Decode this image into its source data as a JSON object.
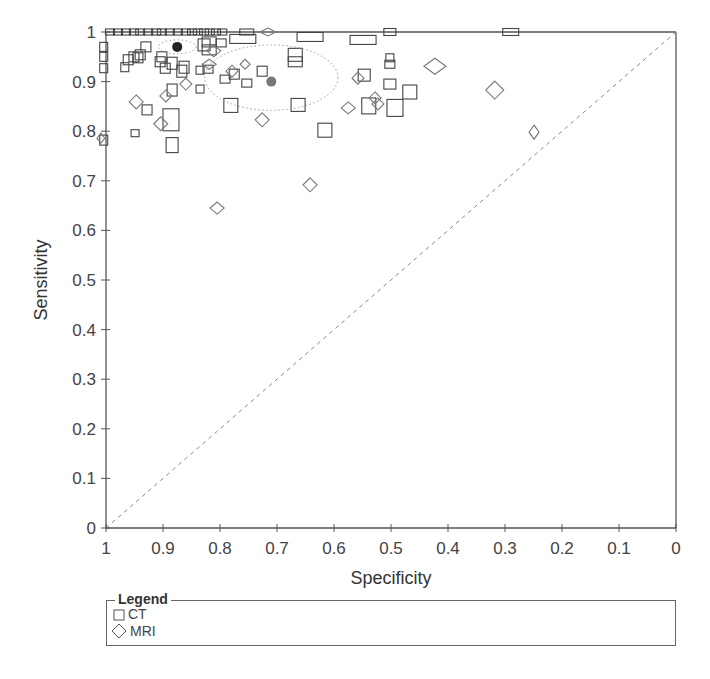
{
  "chart_data": {
    "type": "scatter",
    "title": "",
    "xlabel": "Specificity",
    "ylabel": "Sensitivity",
    "xlim": [
      1,
      0
    ],
    "ylim": [
      0,
      1
    ],
    "x_reversed": true,
    "x_ticks": [
      "1",
      "0.9",
      "0.8",
      "0.7",
      "0.6",
      "0.5",
      "0.4",
      "0.3",
      "0.2",
      "0.1",
      "0"
    ],
    "y_ticks": [
      "0",
      "0.1",
      "0.2",
      "0.3",
      "0.4",
      "0.5",
      "0.6",
      "0.7",
      "0.8",
      "0.9",
      "1"
    ],
    "grid": false,
    "reference_line": {
      "type": "diagonal-dashed",
      "from": [
        1,
        0
      ],
      "to": [
        0,
        1
      ],
      "color": "#888888"
    },
    "legend": {
      "title": "Legend",
      "position": "below",
      "entries": [
        {
          "label": "CT",
          "marker": "square"
        },
        {
          "label": "MRI",
          "marker": "diamond"
        }
      ]
    },
    "summary_points": [
      {
        "series": "CT",
        "specificity": 0.875,
        "sensitivity": 0.97,
        "color": "#222222",
        "confidence_region": {
          "rx_spec": 0.033,
          "ry_sens": 0.014
        }
      },
      {
        "series": "MRI",
        "specificity": 0.71,
        "sensitivity": 0.9,
        "color": "#777777",
        "confidence_region": {
          "rx_spec": 0.117,
          "ry_sens": 0.066
        }
      }
    ],
    "series": [
      {
        "name": "CT",
        "marker": "square",
        "points": [
          {
            "spec": 0.993,
            "sens": 1.0,
            "w": 9,
            "h": 6
          },
          {
            "spec": 0.979,
            "sens": 1.0,
            "w": 9,
            "h": 6
          },
          {
            "spec": 0.965,
            "sens": 1.0,
            "w": 9,
            "h": 6
          },
          {
            "spec": 0.951,
            "sens": 1.0,
            "w": 9,
            "h": 6
          },
          {
            "spec": 0.94,
            "sens": 1.0,
            "w": 9,
            "h": 6
          },
          {
            "spec": 0.926,
            "sens": 1.0,
            "w": 9,
            "h": 6
          },
          {
            "spec": 0.912,
            "sens": 1.0,
            "w": 9,
            "h": 6
          },
          {
            "spec": 0.902,
            "sens": 1.0,
            "w": 9,
            "h": 6
          },
          {
            "spec": 0.888,
            "sens": 1.0,
            "w": 9,
            "h": 6
          },
          {
            "spec": 0.874,
            "sens": 1.0,
            "w": 9,
            "h": 6
          },
          {
            "spec": 0.86,
            "sens": 1.0,
            "w": 9,
            "h": 6
          },
          {
            "spec": 0.849,
            "sens": 1.0,
            "w": 9,
            "h": 6
          },
          {
            "spec": 0.839,
            "sens": 1.0,
            "w": 9,
            "h": 6
          },
          {
            "spec": 0.828,
            "sens": 1.0,
            "w": 9,
            "h": 6
          },
          {
            "spec": 0.818,
            "sens": 1.0,
            "w": 9,
            "h": 6
          },
          {
            "spec": 0.807,
            "sens": 1.0,
            "w": 9,
            "h": 6
          },
          {
            "spec": 0.796,
            "sens": 1.0,
            "w": 9,
            "h": 6
          },
          {
            "spec": 0.753,
            "sens": 1.0,
            "w": 14,
            "h": 6
          },
          {
            "spec": 0.502,
            "sens": 1.0,
            "w": 12,
            "h": 7
          },
          {
            "spec": 0.29,
            "sens": 1.0,
            "w": 16,
            "h": 7
          },
          {
            "spec": 0.76,
            "sens": 0.986,
            "w": 26,
            "h": 9
          },
          {
            "spec": 0.642,
            "sens": 0.99,
            "w": 26,
            "h": 9
          },
          {
            "spec": 0.549,
            "sens": 0.984,
            "w": 26,
            "h": 9
          },
          {
            "spec": 1.004,
            "sens": 0.97,
            "w": 8,
            "h": 9
          },
          {
            "spec": 1.004,
            "sens": 0.95,
            "w": 8,
            "h": 9
          },
          {
            "spec": 1.004,
            "sens": 0.927,
            "w": 8,
            "h": 9
          },
          {
            "spec": 1.004,
            "sens": 0.782,
            "w": 8,
            "h": 10
          },
          {
            "spec": 0.961,
            "sens": 0.944,
            "w": 10,
            "h": 10
          },
          {
            "spec": 0.967,
            "sens": 0.929,
            "w": 8,
            "h": 9
          },
          {
            "spec": 0.951,
            "sens": 0.95,
            "w": 10,
            "h": 10
          },
          {
            "spec": 0.94,
            "sens": 0.954,
            "w": 10,
            "h": 10
          },
          {
            "spec": 0.93,
            "sens": 0.97,
            "w": 10,
            "h": 10
          },
          {
            "spec": 0.944,
            "sens": 0.948,
            "w": 10,
            "h": 10
          },
          {
            "spec": 0.905,
            "sens": 0.94,
            "w": 10,
            "h": 10
          },
          {
            "spec": 0.896,
            "sens": 0.927,
            "w": 10,
            "h": 10
          },
          {
            "spec": 0.902,
            "sens": 0.95,
            "w": 10,
            "h": 10
          },
          {
            "spec": 0.884,
            "sens": 0.937,
            "w": 10,
            "h": 12
          },
          {
            "spec": 0.867,
            "sens": 0.921,
            "w": 10,
            "h": 12
          },
          {
            "spec": 0.863,
            "sens": 0.929,
            "w": 10,
            "h": 12
          },
          {
            "spec": 0.828,
            "sens": 0.974,
            "w": 12,
            "h": 12
          },
          {
            "spec": 0.819,
            "sens": 0.98,
            "w": 14,
            "h": 10
          },
          {
            "spec": 0.819,
            "sens": 0.964,
            "w": 14,
            "h": 10
          },
          {
            "spec": 0.798,
            "sens": 0.978,
            "w": 10,
            "h": 8
          },
          {
            "spec": 0.791,
            "sens": 0.905,
            "w": 10,
            "h": 8
          },
          {
            "spec": 0.775,
            "sens": 0.915,
            "w": 10,
            "h": 10
          },
          {
            "spec": 0.835,
            "sens": 0.923,
            "w": 8,
            "h": 8
          },
          {
            "spec": 0.835,
            "sens": 0.885,
            "w": 8,
            "h": 8
          },
          {
            "spec": 0.753,
            "sens": 0.897,
            "w": 10,
            "h": 8
          },
          {
            "spec": 0.821,
            "sens": 0.925,
            "w": 10,
            "h": 8
          },
          {
            "spec": 0.884,
            "sens": 0.883,
            "w": 10,
            "h": 12
          },
          {
            "spec": 0.886,
            "sens": 0.823,
            "w": 16,
            "h": 22
          },
          {
            "spec": 0.928,
            "sens": 0.843,
            "w": 10,
            "h": 10
          },
          {
            "spec": 0.949,
            "sens": 0.796,
            "w": 8,
            "h": 7
          },
          {
            "spec": 0.884,
            "sens": 0.772,
            "w": 12,
            "h": 15
          },
          {
            "spec": 0.726,
            "sens": 0.921,
            "w": 10,
            "h": 10
          },
          {
            "spec": 0.668,
            "sens": 0.954,
            "w": 14,
            "h": 13
          },
          {
            "spec": 0.668,
            "sens": 0.94,
            "w": 14,
            "h": 10
          },
          {
            "spec": 0.663,
            "sens": 0.853,
            "w": 14,
            "h": 13
          },
          {
            "spec": 0.616,
            "sens": 0.802,
            "w": 14,
            "h": 14
          },
          {
            "spec": 0.493,
            "sens": 0.847,
            "w": 16,
            "h": 17
          },
          {
            "spec": 0.467,
            "sens": 0.879,
            "w": 14,
            "h": 14
          },
          {
            "spec": 0.539,
            "sens": 0.851,
            "w": 14,
            "h": 16
          },
          {
            "spec": 0.547,
            "sens": 0.913,
            "w": 12,
            "h": 12
          },
          {
            "spec": 0.502,
            "sens": 0.935,
            "w": 10,
            "h": 8
          },
          {
            "spec": 0.502,
            "sens": 0.948,
            "w": 8,
            "h": 8
          },
          {
            "spec": 0.502,
            "sens": 0.895,
            "w": 12,
            "h": 10
          },
          {
            "spec": 0.781,
            "sens": 0.852,
            "w": 14,
            "h": 14
          }
        ]
      },
      {
        "name": "MRI",
        "marker": "diamond",
        "points": [
          {
            "spec": 0.716,
            "sens": 1.0,
            "w": 16,
            "h": 8
          },
          {
            "spec": 0.779,
            "sens": 0.921,
            "w": 12,
            "h": 12
          },
          {
            "spec": 0.947,
            "sens": 0.859,
            "w": 14,
            "h": 14
          },
          {
            "spec": 0.895,
            "sens": 0.871,
            "w": 12,
            "h": 12
          },
          {
            "spec": 0.86,
            "sens": 0.895,
            "w": 12,
            "h": 12
          },
          {
            "spec": 0.904,
            "sens": 0.815,
            "w": 14,
            "h": 14
          },
          {
            "spec": 0.811,
            "sens": 0.962,
            "w": 14,
            "h": 12
          },
          {
            "spec": 0.726,
            "sens": 0.823,
            "w": 14,
            "h": 14
          },
          {
            "spec": 0.756,
            "sens": 0.935,
            "w": 10,
            "h": 10
          },
          {
            "spec": 0.558,
            "sens": 0.907,
            "w": 12,
            "h": 12
          },
          {
            "spec": 0.528,
            "sens": 0.867,
            "w": 12,
            "h": 12
          },
          {
            "spec": 0.523,
            "sens": 0.855,
            "w": 12,
            "h": 12
          },
          {
            "spec": 0.423,
            "sens": 0.931,
            "w": 22,
            "h": 16
          },
          {
            "spec": 0.318,
            "sens": 0.883,
            "w": 18,
            "h": 18
          },
          {
            "spec": 0.249,
            "sens": 0.798,
            "w": 10,
            "h": 14
          },
          {
            "spec": 0.805,
            "sens": 0.645,
            "w": 14,
            "h": 12
          },
          {
            "spec": 0.642,
            "sens": 0.692,
            "w": 14,
            "h": 14
          },
          {
            "spec": 1.009,
            "sens": 0.786,
            "w": 8,
            "h": 10
          },
          {
            "spec": 0.819,
            "sens": 0.935,
            "w": 14,
            "h": 10
          },
          {
            "spec": 0.575,
            "sens": 0.847,
            "w": 14,
            "h": 12
          }
        ]
      }
    ]
  },
  "axes": {
    "x_title": "Specificity",
    "y_title": "Sensitivity"
  },
  "legend": {
    "title": "Legend",
    "items": [
      {
        "label": "CT",
        "icon": "square-icon"
      },
      {
        "label": "MRI",
        "icon": "diamond-icon"
      }
    ]
  }
}
